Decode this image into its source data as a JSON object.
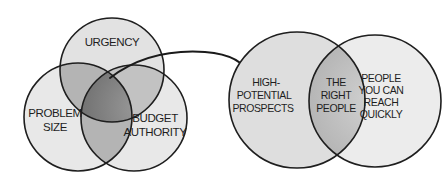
{
  "left_venn": {
    "circles": [
      {
        "id": "urgency",
        "label_lines": [
          "URGENCY"
        ]
      },
      {
        "id": "problem-size",
        "label_lines": [
          "PROBLEM",
          "SIZE"
        ]
      },
      {
        "id": "budget-authority",
        "label_lines": [
          "BUDGET",
          "AUTHORITY"
        ]
      }
    ]
  },
  "right_venn": {
    "left_circle": {
      "label_lines": [
        "HIGH-",
        "POTENTIAL",
        "PROSPECTS"
      ]
    },
    "intersection": {
      "label_lines": [
        "THE",
        "RIGHT",
        "PEOPLE"
      ]
    },
    "right_circle": {
      "label_lines": [
        "PEOPLE",
        "YOU CAN",
        "REACH",
        "QUICKLY"
      ]
    }
  },
  "colors": {
    "outline": "#1e1e1e",
    "fill_light": "#e6e6e6",
    "fill_mid": "#b9b9b9",
    "fill_dark": "#7e7e7e",
    "background": "#ffffff"
  }
}
